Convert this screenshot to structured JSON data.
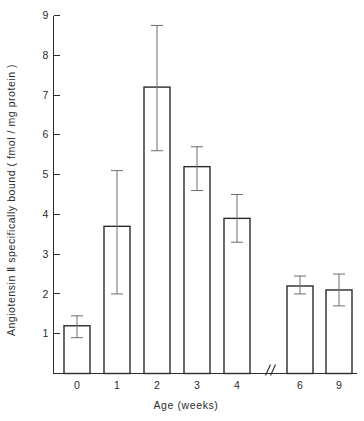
{
  "chart_data": {
    "type": "bar",
    "title": "",
    "xlabel": "Age (weeks)",
    "ylabel": "Angiotensin Ⅱ specifically bound ( fmol / mg protein )",
    "categories": [
      "0",
      "1",
      "2",
      "3",
      "4",
      "6",
      "9"
    ],
    "values": [
      1.2,
      3.7,
      7.2,
      5.2,
      3.9,
      2.2,
      2.1
    ],
    "errors_low": [
      0.9,
      2.0,
      5.6,
      4.6,
      3.3,
      2.0,
      1.7
    ],
    "errors_high": [
      1.45,
      5.1,
      8.75,
      5.7,
      4.5,
      2.45,
      2.5
    ],
    "ylim": [
      0,
      9
    ],
    "yticks": [
      1,
      2,
      3,
      4,
      5,
      6,
      7,
      8,
      9
    ],
    "ytick_labels": [
      "1",
      "2",
      "3",
      "4",
      "5",
      "6",
      "7",
      "8",
      "9"
    ],
    "xtick_labels": [
      "0",
      "1",
      "2",
      "3",
      "4",
      "6",
      "9"
    ],
    "axis_break": {
      "present": true,
      "symbol": "//",
      "between": [
        "4",
        "6"
      ]
    },
    "grid": false,
    "legend": null,
    "bar_fill_color": "#ffffff",
    "bar_edge_color": "#2b2b2b",
    "error_bar_color": "#6e6e6e",
    "background_color": "#ffffff"
  }
}
